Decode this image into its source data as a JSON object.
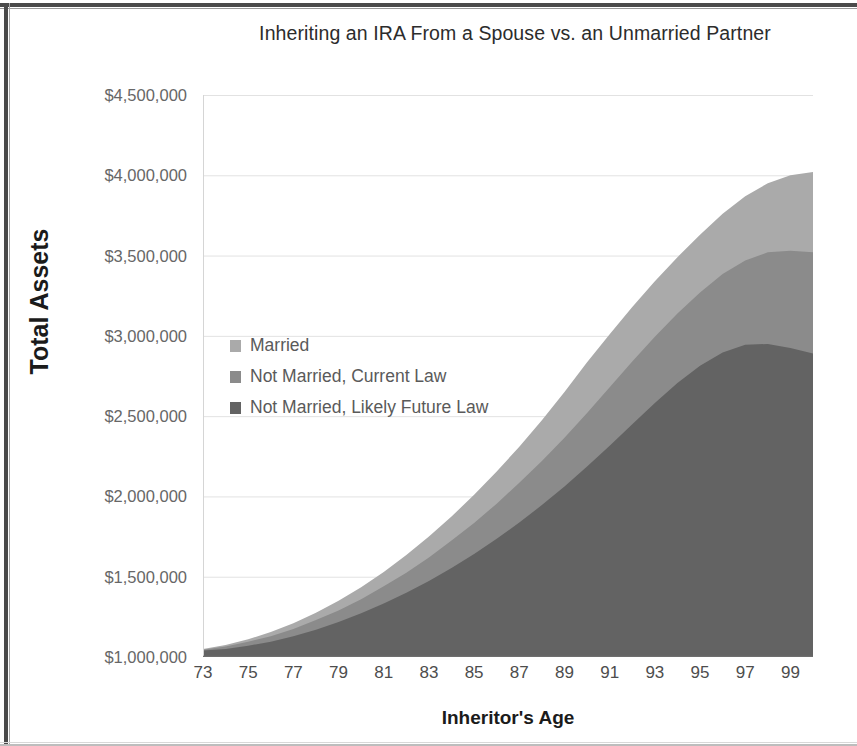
{
  "chart_data": {
    "type": "area",
    "stacked": false,
    "title": "Inheriting an IRA From a Spouse vs. an Unmarried Partner",
    "xlabel": "Inheritor's Age",
    "ylabel": "Total Assets",
    "xlim": [
      73,
      100
    ],
    "ylim": [
      1000000,
      4500000
    ],
    "grid": true,
    "grid_axis": "y",
    "legend_position": "inside-left",
    "y_ticks": [
      "$4,500,000",
      "$4,000,000",
      "$3,500,000",
      "$3,000,000",
      "$2,500,000",
      "$2,000,000",
      "$1,500,000",
      "$1,000,000"
    ],
    "y_tick_values": [
      4500000,
      4000000,
      3500000,
      3000000,
      2500000,
      2000000,
      1500000,
      1000000
    ],
    "x_ticks": [
      "73",
      "75",
      "77",
      "79",
      "81",
      "83",
      "85",
      "87",
      "89",
      "91",
      "93",
      "95",
      "97",
      "99"
    ],
    "x_tick_values": [
      73,
      75,
      77,
      79,
      81,
      83,
      85,
      87,
      89,
      91,
      93,
      95,
      97,
      99
    ],
    "x": [
      73,
      74,
      75,
      76,
      77,
      78,
      79,
      80,
      81,
      82,
      83,
      84,
      85,
      86,
      87,
      88,
      89,
      90,
      91,
      92,
      93,
      94,
      95,
      96,
      97,
      98,
      99,
      100
    ],
    "series": [
      {
        "name": "Married",
        "color": "#aaaaaa",
        "values": [
          1050000,
          1075000,
          1110000,
          1155000,
          1210000,
          1275000,
          1350000,
          1435000,
          1530000,
          1635000,
          1750000,
          1875000,
          2010000,
          2155000,
          2310000,
          2475000,
          2650000,
          2835000,
          3010000,
          3180000,
          3340000,
          3490000,
          3630000,
          3760000,
          3870000,
          3950000,
          4000000,
          4020000
        ]
      },
      {
        "name": "Not Married, Current Law",
        "color": "#8b8b8b",
        "values": [
          1045000,
          1065000,
          1095000,
          1130000,
          1175000,
          1230000,
          1290000,
          1360000,
          1440000,
          1525000,
          1620000,
          1725000,
          1835000,
          1955000,
          2085000,
          2220000,
          2365000,
          2520000,
          2680000,
          2840000,
          2995000,
          3140000,
          3270000,
          3385000,
          3470000,
          3520000,
          3530000,
          3520000
        ]
      },
      {
        "name": "Not Married, Likely Future Law",
        "color": "#636363",
        "values": [
          1040000,
          1050000,
          1070000,
          1095000,
          1130000,
          1170000,
          1218000,
          1272000,
          1333000,
          1400000,
          1474000,
          1555000,
          1642000,
          1736000,
          1838000,
          1946000,
          2062000,
          2186000,
          2316000,
          2450000,
          2582000,
          2706000,
          2814000,
          2896000,
          2944000,
          2950000,
          2925000,
          2890000
        ]
      }
    ]
  }
}
